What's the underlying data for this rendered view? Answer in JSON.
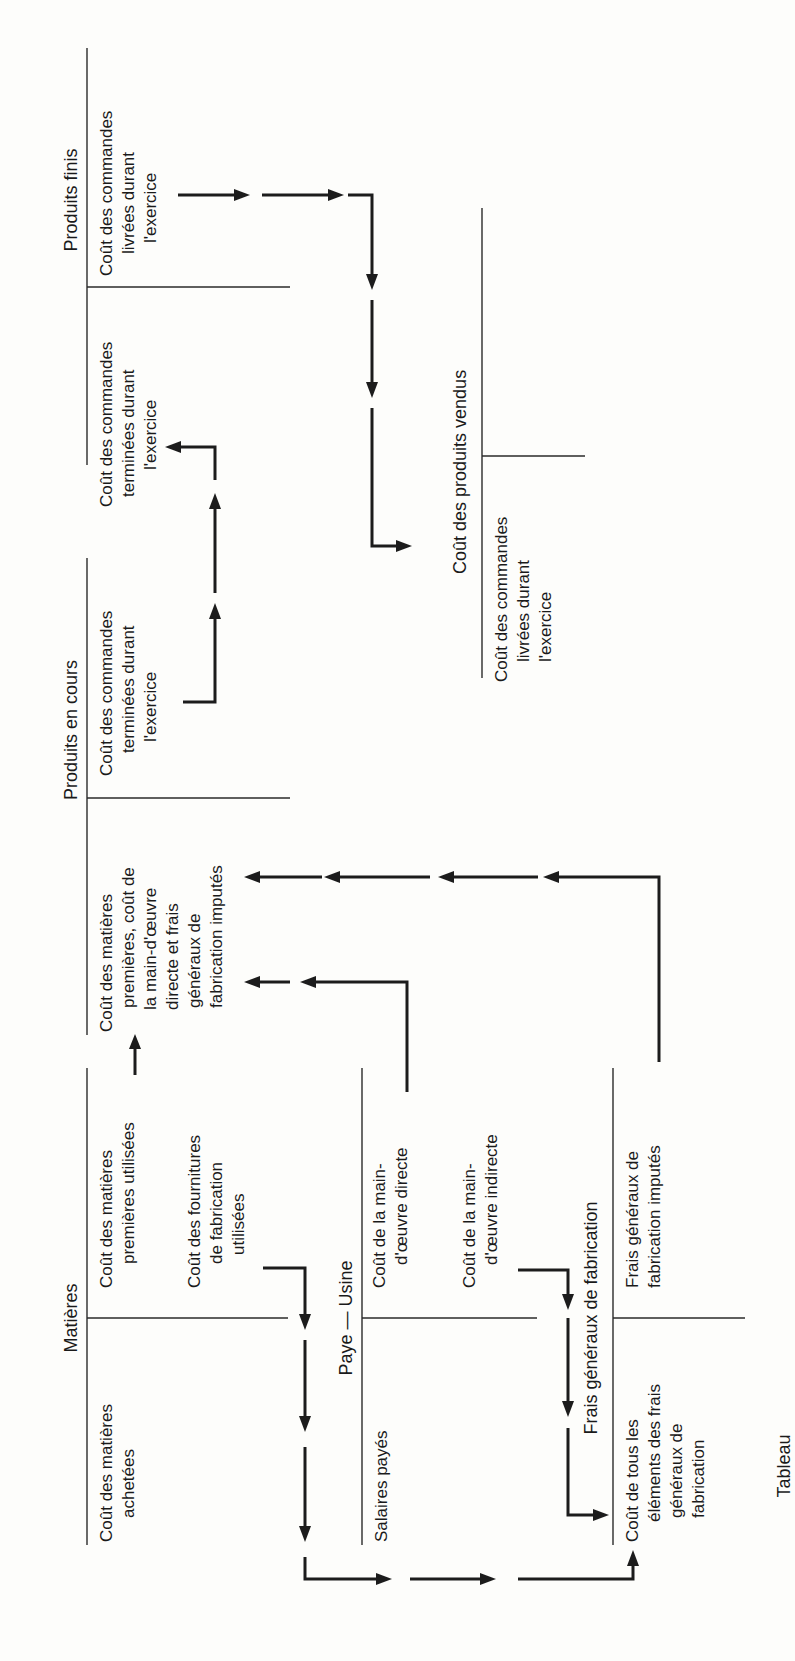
{
  "caption": "Tableau",
  "accounts": {
    "produits_finis": {
      "title": "Produits finis",
      "debit": [
        "Coût des commandes",
        "terminées durant",
        "l'exercice"
      ],
      "credit": [
        "Coût des commandes",
        "livrées durant",
        "l'exercice"
      ]
    },
    "produits_en_cours": {
      "title": "Produits en cours",
      "debit": [
        "Coût des matières",
        "premières, coût de",
        "la main-d'œuvre",
        "directe et frais",
        "généraux de",
        "fabrication imputés"
      ],
      "credit": [
        "Coût des commandes",
        "terminées durant",
        "l'exercice"
      ]
    },
    "cout_produits_vendus": {
      "title": "Coût des produits vendus",
      "debit": [
        "Coût des commandes",
        "livrées durant",
        "l'exercice"
      ]
    },
    "matieres": {
      "title": "Matières",
      "debit": [
        "Coût des matières",
        "achetées"
      ],
      "credit_1": [
        "Coût des matières",
        "premières utilisées"
      ],
      "credit_2": [
        "Coût des fournitures",
        "de fabrication",
        "utilisées"
      ]
    },
    "paye_usine": {
      "title": "Paye — Usine",
      "debit": [
        "Salaires payés"
      ],
      "credit_1": [
        "Coût de la main-",
        "d'œuvre directe"
      ],
      "credit_2": [
        "Coût de la main-",
        "d'œuvre indirecte"
      ]
    },
    "frais_generaux": {
      "title": "Frais généraux de fabrication",
      "debit": [
        "Coût de tous les",
        "éléments des frais",
        "généraux de",
        "fabrication"
      ],
      "credit": [
        "Frais généraux de",
        "fabrication imputés"
      ]
    }
  },
  "colors": {
    "ink": "#1c1c1c",
    "paper": "#fdfdfb"
  }
}
